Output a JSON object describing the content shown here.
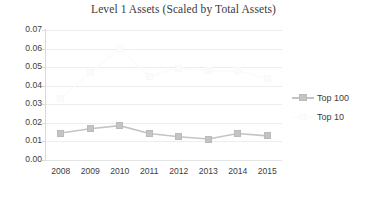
{
  "chart_data": {
    "type": "line",
    "title": "Level 1 Assets (Scaled by Total Assets)",
    "xlabel": "",
    "ylabel": "",
    "categories": [
      "2008",
      "2009",
      "2010",
      "2011",
      "2012",
      "2013",
      "2014",
      "2015"
    ],
    "ylim": [
      0.0,
      0.07
    ],
    "ytick_step": 0.01,
    "ytick_labels": [
      "0.07",
      "0.06",
      "0.05",
      "0.04",
      "0.03",
      "0.02",
      "0.01",
      "0.00"
    ],
    "ytick_values": [
      0.07,
      0.06,
      0.05,
      0.04,
      0.03,
      0.02,
      0.01,
      0.0
    ],
    "grid": true,
    "legend_position": "right",
    "series": [
      {
        "name": "Top 100",
        "color": "#c3c5c5",
        "marker": "square",
        "values": [
          0.0145,
          0.0168,
          0.0185,
          0.0143,
          0.0125,
          0.0113,
          0.0143,
          0.013
        ]
      },
      {
        "name": "Top 10",
        "color": "#fbfbfb",
        "marker": "square",
        "values": [
          0.033,
          0.047,
          0.06,
          0.045,
          0.0495,
          0.048,
          0.048,
          0.044
        ]
      }
    ]
  },
  "legend": {
    "items": [
      {
        "label": "Top 100"
      },
      {
        "label": "Top 10"
      }
    ]
  }
}
